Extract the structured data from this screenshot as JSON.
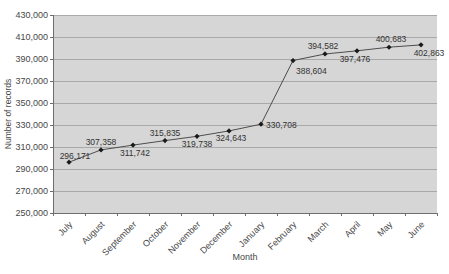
{
  "chart_data": {
    "type": "line",
    "title": "",
    "xlabel": "Month",
    "ylabel": "Number of records",
    "categories": [
      "July",
      "August",
      "September",
      "October",
      "November",
      "December",
      "January",
      "February",
      "March",
      "April",
      "May",
      "June"
    ],
    "series": [
      {
        "name": "Number of records",
        "values": [
          296171,
          307358,
          311742,
          315835,
          319738,
          324643,
          330708,
          388604,
          394582,
          397476,
          400683,
          402863
        ]
      }
    ],
    "ylim": [
      250000,
      430000
    ],
    "ytick_step": 20000,
    "grid": "horizontal",
    "legend": "none",
    "marker": "diamond",
    "colors": {
      "plot_bg": "#d6d6d6",
      "gridline": "#a9a9a9",
      "axis": "#6e6e6e",
      "line": "#4d4d4d",
      "marker": "#1a1a1a",
      "text": "#474747"
    },
    "label_layout": [
      {
        "dx": 6,
        "dy": -3,
        "anchor": "middle"
      },
      {
        "dx": 0,
        "dy": -5,
        "anchor": "middle"
      },
      {
        "dx": 2,
        "dy": 11,
        "anchor": "middle"
      },
      {
        "dx": 0,
        "dy": -5,
        "anchor": "middle"
      },
      {
        "dx": 0,
        "dy": 11,
        "anchor": "middle"
      },
      {
        "dx": 2,
        "dy": 10,
        "anchor": "middle"
      },
      {
        "dx": 5,
        "dy": 4,
        "anchor": "start"
      },
      {
        "dx": 3,
        "dy": 13,
        "anchor": "start"
      },
      {
        "dx": -2,
        "dy": -5,
        "anchor": "middle"
      },
      {
        "dx": -2,
        "dy": 11,
        "anchor": "middle"
      },
      {
        "dx": 2,
        "dy": -5,
        "anchor": "middle"
      },
      {
        "dx": 8,
        "dy": 11,
        "anchor": "middle"
      }
    ]
  }
}
